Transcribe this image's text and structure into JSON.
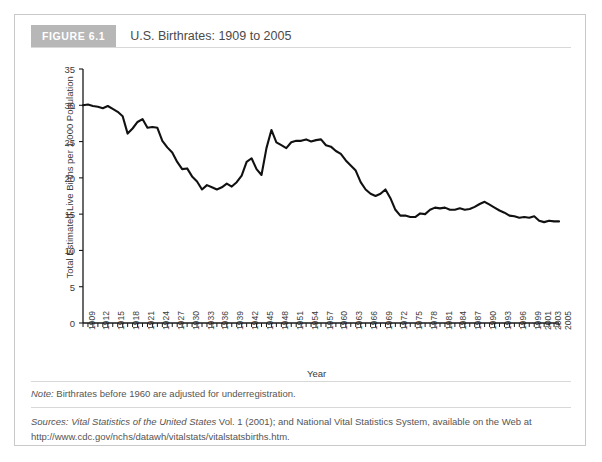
{
  "figure": {
    "badge": "FIGURE 6.1",
    "title": "U.S. Birthrates: 1909 to 2005",
    "note_label": "Note:",
    "note_body": " Birthrates before 1960 are adjusted for underregistration.",
    "sources_label": "Sources:",
    "sources_italic_part": " Vital Statistics of the United States",
    "sources_body": " Vol. 1 (2001); and National Vital Statistics System, available on the Web at http://www.cdc.gov/nchs/datawh/vitalstats/vitalstatsbirths.htm."
  },
  "colors": {
    "badge_bg": "#b7b7b7",
    "badge_text": "#ffffff",
    "card_border": "#c9c9c9",
    "rule": "#d8d8d8",
    "axis": "#1a1a1a",
    "line": "#111111",
    "tick_text": "#3a3a3a",
    "footnote_text": "#555555"
  },
  "chart_data": {
    "type": "line",
    "title": "U.S. Birthrates: 1909 to 2005",
    "xlabel": "Year",
    "ylabel": "Total Estimated Live Births per 1,000 Population",
    "xlim": [
      1909,
      2005
    ],
    "ylim": [
      0,
      35
    ],
    "yticks": [
      0,
      5,
      10,
      15,
      20,
      25,
      30,
      35
    ],
    "grid": false,
    "legend": "none",
    "xtick_labels": [
      "1909",
      "1912",
      "1915",
      "1918",
      "1921",
      "1924",
      "1927",
      "1930",
      "1933",
      "1936",
      "1939",
      "1942",
      "1945",
      "1948",
      "1951",
      "1954",
      "1957",
      "1960",
      "1963",
      "1966",
      "1969",
      "1972",
      "1975",
      "1978",
      "1981",
      "1984",
      "1987",
      "1990",
      "1993",
      "1996",
      "1999",
      "2001",
      "2003",
      "2005"
    ],
    "x": [
      1909,
      1910,
      1911,
      1912,
      1913,
      1914,
      1915,
      1916,
      1917,
      1918,
      1919,
      1920,
      1921,
      1922,
      1923,
      1924,
      1925,
      1926,
      1927,
      1928,
      1929,
      1930,
      1931,
      1932,
      1933,
      1934,
      1935,
      1936,
      1937,
      1938,
      1939,
      1940,
      1941,
      1942,
      1943,
      1944,
      1945,
      1946,
      1947,
      1948,
      1949,
      1950,
      1951,
      1952,
      1953,
      1954,
      1955,
      1956,
      1957,
      1958,
      1959,
      1960,
      1961,
      1962,
      1963,
      1964,
      1965,
      1966,
      1967,
      1968,
      1969,
      1970,
      1971,
      1972,
      1973,
      1974,
      1975,
      1976,
      1977,
      1978,
      1979,
      1980,
      1981,
      1982,
      1983,
      1984,
      1985,
      1986,
      1987,
      1988,
      1989,
      1990,
      1991,
      1992,
      1993,
      1994,
      1995,
      1996,
      1997,
      1998,
      1999,
      2000,
      2001,
      2002,
      2003,
      2004,
      2005
    ],
    "values": [
      30.0,
      30.1,
      29.9,
      29.8,
      29.6,
      29.9,
      29.5,
      29.1,
      28.5,
      26.1,
      26.8,
      27.7,
      28.1,
      26.9,
      27.0,
      26.9,
      25.1,
      24.2,
      23.5,
      22.2,
      21.2,
      21.3,
      20.2,
      19.5,
      18.4,
      19.0,
      18.7,
      18.4,
      18.7,
      19.2,
      18.8,
      19.4,
      20.3,
      22.2,
      22.7,
      21.2,
      20.4,
      24.1,
      26.6,
      24.9,
      24.5,
      24.1,
      24.9,
      25.1,
      25.1,
      25.3,
      25.0,
      25.2,
      25.3,
      24.5,
      24.3,
      23.7,
      23.3,
      22.4,
      21.7,
      21.0,
      19.4,
      18.4,
      17.8,
      17.5,
      17.8,
      18.4,
      17.2,
      15.6,
      14.8,
      14.8,
      14.6,
      14.6,
      15.1,
      15.0,
      15.6,
      15.9,
      15.8,
      15.9,
      15.6,
      15.6,
      15.8,
      15.6,
      15.7,
      16.0,
      16.4,
      16.7,
      16.3,
      15.9,
      15.5,
      15.2,
      14.8,
      14.7,
      14.5,
      14.6,
      14.5,
      14.7,
      14.1,
      13.9,
      14.1,
      14.0,
      14.0
    ]
  }
}
